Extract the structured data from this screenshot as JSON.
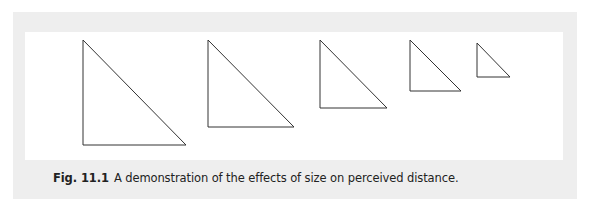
{
  "figure": {
    "label": "Fig. 11.1",
    "caption": "A demonstration of the effects of size on perceived distance.",
    "colors": {
      "box_background": "#eeeeee",
      "panel_background": "#ffffff",
      "stroke": "#333333"
    },
    "triangles": [
      {
        "id": 1,
        "top": [
          83,
          40
        ],
        "bottom_left": [
          83,
          145
        ],
        "bottom_right": [
          186,
          145
        ]
      },
      {
        "id": 2,
        "top": [
          208,
          40
        ],
        "bottom_left": [
          208,
          127
        ],
        "bottom_right": [
          294,
          127
        ]
      },
      {
        "id": 3,
        "top": [
          320,
          40
        ],
        "bottom_left": [
          320,
          108
        ],
        "bottom_right": [
          387,
          108
        ]
      },
      {
        "id": 4,
        "top": [
          410,
          40
        ],
        "bottom_left": [
          410,
          91
        ],
        "bottom_right": [
          461,
          91
        ]
      },
      {
        "id": 5,
        "top": [
          477,
          43
        ],
        "bottom_left": [
          477,
          77
        ],
        "bottom_right": [
          510,
          77
        ]
      }
    ]
  }
}
